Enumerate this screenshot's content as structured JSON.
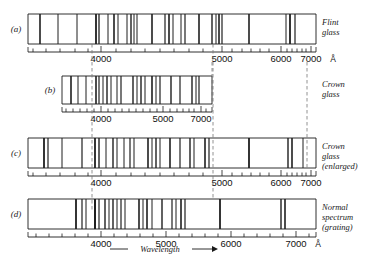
{
  "figure": {
    "title_unit": "Å",
    "axis_caption": "Wavelength",
    "arrow_glyph": "⟶"
  },
  "panels": [
    {
      "id": "a",
      "label": "(a)",
      "side_label_lines": [
        "Flint",
        "glass"
      ],
      "strip": {
        "x": 28,
        "y": 14,
        "width": 288,
        "height": 30
      },
      "scale_type": "prism-flint",
      "tick_labels": [
        {
          "text": "4000",
          "x": 101
        },
        {
          "text": "5000",
          "x": 222
        },
        {
          "text": "6000",
          "x": 281
        },
        {
          "text": "7000",
          "x": 311
        }
      ],
      "major_ticks": [
        101,
        222,
        281,
        311
      ],
      "minor_ticks": [
        33,
        46,
        60,
        75,
        88,
        116,
        131,
        145,
        160,
        174,
        189,
        203,
        232,
        242,
        251,
        260,
        269,
        287,
        292,
        297,
        302,
        306
      ],
      "lines": [
        {
          "x": 40,
          "w": 1.6,
          "c": "#2a2a2a"
        },
        {
          "x": 58,
          "w": 1.0,
          "c": "#3a3a3a"
        },
        {
          "x": 77,
          "w": 1.0,
          "c": "#4a4a4a"
        },
        {
          "x": 96,
          "w": 1.8,
          "c": "#1a1a1a"
        },
        {
          "x": 99,
          "w": 1.3,
          "c": "#1a1a1a"
        },
        {
          "x": 108,
          "w": 1.0,
          "c": "#3a3a3a"
        },
        {
          "x": 114,
          "w": 1.6,
          "c": "#2a2a2a"
        },
        {
          "x": 118,
          "w": 1.0,
          "c": "#555555"
        },
        {
          "x": 127,
          "w": 1.0,
          "c": "#4a4a4a"
        },
        {
          "x": 131,
          "w": 1.4,
          "c": "#2a2a2a"
        },
        {
          "x": 134,
          "w": 1.0,
          "c": "#666666"
        },
        {
          "x": 137,
          "w": 1.0,
          "c": "#3a3a3a"
        },
        {
          "x": 152,
          "w": 1.6,
          "c": "#1f1f1f"
        },
        {
          "x": 165,
          "w": 1.2,
          "c": "#3a3a3a"
        },
        {
          "x": 169,
          "w": 1.6,
          "c": "#1f1f1f"
        },
        {
          "x": 173,
          "w": 1.0,
          "c": "#4a4a4a"
        },
        {
          "x": 181,
          "w": 1.0,
          "c": "#3a3a3a"
        },
        {
          "x": 185,
          "w": 1.2,
          "c": "#2a2a2a"
        },
        {
          "x": 199,
          "w": 1.6,
          "c": "#1f1f1f"
        },
        {
          "x": 212,
          "w": 1.4,
          "c": "#2a2a2a"
        },
        {
          "x": 216,
          "w": 1.0,
          "c": "#4a4a4a"
        },
        {
          "x": 219,
          "w": 1.6,
          "c": "#1a1a1a"
        },
        {
          "x": 222,
          "w": 1.2,
          "c": "#2a2a2a"
        },
        {
          "x": 249,
          "w": 1.6,
          "c": "#1f1f1f"
        },
        {
          "x": 286,
          "w": 1.0,
          "c": "#3a3a3a"
        },
        {
          "x": 290,
          "w": 1.8,
          "c": "#1a1a1a"
        },
        {
          "x": 295,
          "w": 1.2,
          "c": "#2a2a2a"
        }
      ]
    },
    {
      "id": "b",
      "label": "(b)",
      "side_label_lines": [
        "Crown",
        "glass"
      ],
      "strip": {
        "x": 62,
        "y": 76,
        "width": 150,
        "height": 28
      },
      "scale_type": "prism-crown",
      "tick_labels": [
        {
          "text": "4000",
          "x": 101
        },
        {
          "text": "5000",
          "x": 163
        },
        {
          "text": "7000",
          "x": 201
        }
      ],
      "major_ticks": [
        101,
        163,
        201
      ],
      "minor_ticks": [
        66,
        73,
        80,
        87,
        94,
        108,
        115,
        122,
        129,
        136,
        143,
        150,
        157,
        170,
        177,
        183,
        189,
        194,
        206
      ],
      "lines": [
        {
          "x": 71,
          "w": 1.6,
          "c": "#2a2a2a"
        },
        {
          "x": 78,
          "w": 1.0,
          "c": "#4a4a4a"
        },
        {
          "x": 86,
          "w": 1.0,
          "c": "#4a4a4a"
        },
        {
          "x": 96,
          "w": 1.6,
          "c": "#1a1a1a"
        },
        {
          "x": 99,
          "w": 1.2,
          "c": "#2a2a2a"
        },
        {
          "x": 103,
          "w": 1.0,
          "c": "#3a3a3a"
        },
        {
          "x": 107,
          "w": 1.4,
          "c": "#2a2a2a"
        },
        {
          "x": 111,
          "w": 1.0,
          "c": "#555555"
        },
        {
          "x": 117,
          "w": 1.0,
          "c": "#4a4a4a"
        },
        {
          "x": 121,
          "w": 1.2,
          "c": "#3a3a3a"
        },
        {
          "x": 133,
          "w": 1.4,
          "c": "#1f1f1f"
        },
        {
          "x": 137,
          "w": 1.0,
          "c": "#3a3a3a"
        },
        {
          "x": 141,
          "w": 1.4,
          "c": "#1f1f1f"
        },
        {
          "x": 145,
          "w": 1.0,
          "c": "#4a4a4a"
        },
        {
          "x": 152,
          "w": 1.6,
          "c": "#1a1a1a"
        },
        {
          "x": 156,
          "w": 1.0,
          "c": "#555555"
        },
        {
          "x": 160,
          "w": 1.2,
          "c": "#3a3a3a"
        },
        {
          "x": 171,
          "w": 1.4,
          "c": "#2a2a2a"
        },
        {
          "x": 180,
          "w": 1.2,
          "c": "#3a3a3a"
        },
        {
          "x": 192,
          "w": 1.4,
          "c": "#1f1f1f"
        },
        {
          "x": 196,
          "w": 1.0,
          "c": "#3a3a3a"
        },
        {
          "x": 199,
          "w": 1.2,
          "c": "#2a2a2a"
        }
      ]
    },
    {
      "id": "c",
      "label": "(c)",
      "side_label_lines": [
        "Crown",
        "glass",
        "(enlarged)"
      ],
      "strip": {
        "x": 28,
        "y": 138,
        "width": 288,
        "height": 30
      },
      "scale_type": "prism-crown-enlarged",
      "tick_labels": [
        {
          "text": "4000",
          "x": 101
        },
        {
          "text": "5000",
          "x": 222
        },
        {
          "text": "6000",
          "x": 281
        },
        {
          "text": "7000",
          "x": 311
        }
      ],
      "major_ticks": [
        101,
        222,
        281,
        311
      ],
      "minor_ticks": [
        33,
        46,
        60,
        75,
        88,
        116,
        131,
        145,
        160,
        174,
        189,
        203,
        232,
        242,
        251,
        260,
        269,
        287,
        292,
        297,
        302,
        306
      ],
      "lines": [
        {
          "x": 44,
          "w": 1.8,
          "c": "#1f1f1f"
        },
        {
          "x": 48,
          "w": 1.2,
          "c": "#3a3a3a"
        },
        {
          "x": 62,
          "w": 1.0,
          "c": "#4a4a4a"
        },
        {
          "x": 82,
          "w": 1.2,
          "c": "#3a3a3a"
        },
        {
          "x": 95,
          "w": 1.8,
          "c": "#1a1a1a"
        },
        {
          "x": 99,
          "w": 1.4,
          "c": "#2a2a2a"
        },
        {
          "x": 106,
          "w": 1.0,
          "c": "#4a4a4a"
        },
        {
          "x": 113,
          "w": 1.4,
          "c": "#2a2a2a"
        },
        {
          "x": 117,
          "w": 1.0,
          "c": "#555555"
        },
        {
          "x": 124,
          "w": 1.0,
          "c": "#4a4a4a"
        },
        {
          "x": 130,
          "w": 1.2,
          "c": "#666666"
        },
        {
          "x": 134,
          "w": 1.0,
          "c": "#555555"
        },
        {
          "x": 148,
          "w": 1.6,
          "c": "#1f1f1f"
        },
        {
          "x": 152,
          "w": 1.0,
          "c": "#3a3a3a"
        },
        {
          "x": 156,
          "w": 1.4,
          "c": "#2a2a2a"
        },
        {
          "x": 160,
          "w": 1.0,
          "c": "#4a4a4a"
        },
        {
          "x": 170,
          "w": 1.6,
          "c": "#1a1a1a"
        },
        {
          "x": 180,
          "w": 1.2,
          "c": "#555555"
        },
        {
          "x": 190,
          "w": 1.4,
          "c": "#2a2a2a"
        },
        {
          "x": 194,
          "w": 1.0,
          "c": "#4a4a4a"
        },
        {
          "x": 205,
          "w": 1.6,
          "c": "#1a1a1a"
        },
        {
          "x": 209,
          "w": 1.2,
          "c": "#2a2a2a"
        },
        {
          "x": 249,
          "w": 1.8,
          "c": "#1f1f1f"
        },
        {
          "x": 288,
          "w": 1.4,
          "c": "#1a1a1a"
        },
        {
          "x": 292,
          "w": 1.6,
          "c": "#1a1a1a"
        },
        {
          "x": 303,
          "w": 1.0,
          "c": "#4a4a4a"
        }
      ]
    },
    {
      "id": "d",
      "label": "(d)",
      "side_label_lines": [
        "Normal",
        "spectrum",
        "(grating)"
      ],
      "strip": {
        "x": 28,
        "y": 199,
        "width": 288,
        "height": 30
      },
      "scale_type": "linear-grating",
      "tick_labels": [
        {
          "text": "4000",
          "x": 101
        },
        {
          "text": "5000",
          "x": 166
        },
        {
          "text": "6000",
          "x": 231
        },
        {
          "text": "7000",
          "x": 296
        }
      ],
      "major_ticks": [
        101,
        166,
        231,
        296
      ],
      "minor_ticks": [
        36,
        49,
        62,
        75,
        88,
        114,
        127,
        140,
        153,
        179,
        192,
        205,
        218,
        244,
        257,
        270,
        283,
        309
      ],
      "lines": [
        {
          "x": 76,
          "w": 1.8,
          "c": "#1a1a1a"
        },
        {
          "x": 82,
          "w": 1.2,
          "c": "#3a3a3a"
        },
        {
          "x": 86,
          "w": 1.0,
          "c": "#4a4a4a"
        },
        {
          "x": 95,
          "w": 2.0,
          "c": "#111111"
        },
        {
          "x": 99,
          "w": 1.2,
          "c": "#2a2a2a"
        },
        {
          "x": 105,
          "w": 1.4,
          "c": "#2a2a2a"
        },
        {
          "x": 109,
          "w": 1.0,
          "c": "#4a4a4a"
        },
        {
          "x": 113,
          "w": 1.4,
          "c": "#3a3a3a"
        },
        {
          "x": 117,
          "w": 1.0,
          "c": "#666666"
        },
        {
          "x": 121,
          "w": 1.2,
          "c": "#555555"
        },
        {
          "x": 125,
          "w": 1.0,
          "c": "#777777"
        },
        {
          "x": 139,
          "w": 1.6,
          "c": "#1f1f1f"
        },
        {
          "x": 143,
          "w": 1.0,
          "c": "#3a3a3a"
        },
        {
          "x": 147,
          "w": 1.6,
          "c": "#1a1a1a"
        },
        {
          "x": 152,
          "w": 1.0,
          "c": "#4a4a4a"
        },
        {
          "x": 162,
          "w": 1.4,
          "c": "#2a2a2a"
        },
        {
          "x": 172,
          "w": 1.2,
          "c": "#3a3a3a"
        },
        {
          "x": 176,
          "w": 1.0,
          "c": "#555555"
        },
        {
          "x": 181,
          "w": 1.6,
          "c": "#1a1a1a"
        },
        {
          "x": 185,
          "w": 1.2,
          "c": "#2a2a2a"
        },
        {
          "x": 220,
          "w": 1.8,
          "c": "#1f1f1f"
        },
        {
          "x": 281,
          "w": 1.4,
          "c": "#1a1a1a"
        },
        {
          "x": 285,
          "w": 1.6,
          "c": "#1a1a1a"
        }
      ]
    }
  ],
  "connectors": [
    {
      "name": "connector-4000",
      "x": 92,
      "y1": 44,
      "y2": 212
    },
    {
      "name": "connector-5000",
      "x": 213,
      "y1": 44,
      "y2": 199
    },
    {
      "name": "connector-7000-b",
      "x": 212,
      "y1": 62,
      "y2": 104
    },
    {
      "name": "connector-7000-c",
      "x": 307,
      "y1": 62,
      "y2": 168
    }
  ]
}
